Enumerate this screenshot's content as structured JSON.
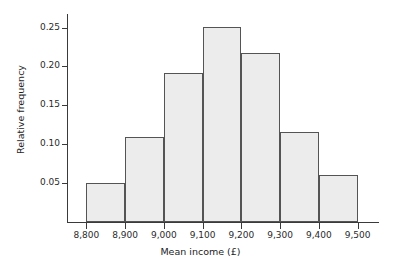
{
  "chart_data": {
    "type": "bar",
    "title": "",
    "subtitle": "",
    "xlabel": "Mean income (£)",
    "ylabel": "Relative frequency",
    "categories": [
      "8,800–8,900",
      "8,900–9,000",
      "9,000–9,100",
      "9,100–9,200",
      "9,200–9,300",
      "9,300–9,400",
      "9,400–9,500"
    ],
    "bin_edges": [
      8800,
      8900,
      9000,
      9100,
      9200,
      9300,
      9400,
      9500
    ],
    "values": [
      0.05,
      0.109,
      0.191,
      0.251,
      0.217,
      0.116,
      0.061
    ],
    "bar_color": "#ececec",
    "bar_edge_color": "#545454",
    "axis_color": "#3a3a3a",
    "xlim": [
      8750,
      9550
    ],
    "ylim": [
      0,
      0.2675
    ],
    "x_ticks": [
      8800,
      8900,
      9000,
      9100,
      9200,
      9300,
      9400,
      9500
    ],
    "x_tick_labels": [
      "8,800",
      "8,900",
      "9,000",
      "9,100",
      "9,200",
      "9,300",
      "9,400",
      "9,500"
    ],
    "y_ticks": [
      0.05,
      0.1,
      0.15,
      0.2,
      0.25
    ],
    "y_tick_labels": [
      "0.05",
      "0.10",
      "0.15",
      "0.20",
      "0.25"
    ],
    "grid": false,
    "legend": null,
    "legend_position": "none"
  }
}
